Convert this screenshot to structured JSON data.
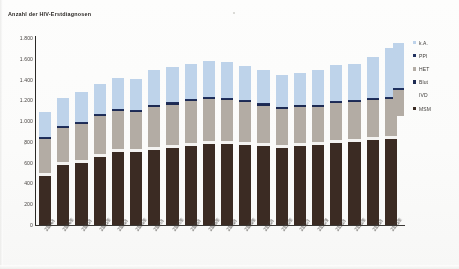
{
  "chart_title": "Anzahl der HIV-Erstdiagnosen",
  "legend": {
    "items": [
      {
        "label": "k.A.",
        "color": "#bed3ea",
        "swatch": "square"
      },
      {
        "label": "PPI",
        "color": "#20305e",
        "swatch": "square"
      },
      {
        "label": "HET",
        "color": "#b3aca4",
        "swatch": "square"
      },
      {
        "label": "Blut",
        "color": "#1d2a52",
        "swatch": "square"
      },
      {
        "label": "IVD",
        "color": "#f4f3f1",
        "swatch": "blank"
      },
      {
        "label": "MSM",
        "color": "#3b2b23",
        "swatch": "square"
      }
    ]
  },
  "chart_data": {
    "type": "bar",
    "stacked": true,
    "title": "Anzahl der HIV-Erstdiagnosen",
    "xlabel": "",
    "ylabel": "Anzahl der HIV-Erstdiagnosen",
    "ylim": [
      0,
      1800
    ],
    "ytick_labels": [
      "1.800",
      "1.600",
      "1.400",
      "1.200",
      "1.000",
      "800",
      "600",
      "400",
      "200",
      "0"
    ],
    "ytick_values": [
      1800,
      1600,
      1400,
      1200,
      1000,
      800,
      600,
      400,
      200,
      0
    ],
    "grid": false,
    "legend_position": "right",
    "categories": [
      "2004/I",
      "2004/II",
      "2005/I",
      "2005/II",
      "2006/I",
      "2006/II",
      "2007/I",
      "2007/II",
      "2008/I",
      "2008/II",
      "2009/I",
      "2009/II",
      "2010/I",
      "2010/II",
      "2011/I",
      "2011/II",
      "2012/I",
      "2012/II",
      "2013/I",
      "2013/II"
    ],
    "series": [
      {
        "name": "MSM",
        "color": "#3b2b23",
        "values": [
          470,
          580,
          600,
          650,
          700,
          700,
          720,
          740,
          760,
          780,
          780,
          770,
          760,
          740,
          760,
          770,
          790,
          800,
          820,
          830
        ]
      },
      {
        "name": "IVD",
        "color": "#f4f3f1",
        "values": [
          30,
          30,
          30,
          30,
          30,
          30,
          30,
          30,
          30,
          30,
          30,
          30,
          30,
          30,
          30,
          30,
          30,
          30,
          30,
          30
        ]
      },
      {
        "name": "HET",
        "color": "#b3aca4",
        "values": [
          330,
          320,
          340,
          370,
          370,
          360,
          390,
          390,
          400,
          400,
          390,
          380,
          360,
          350,
          350,
          340,
          350,
          350,
          350,
          350
        ]
      },
      {
        "name": "Blut",
        "color": "#1d2a52",
        "values": [
          12,
          12,
          12,
          12,
          12,
          12,
          12,
          12,
          12,
          12,
          12,
          12,
          12,
          12,
          12,
          12,
          12,
          12,
          12,
          12
        ]
      },
      {
        "name": "PPI",
        "color": "#20305e",
        "values": [
          8,
          8,
          8,
          8,
          8,
          8,
          8,
          8,
          8,
          8,
          8,
          8,
          8,
          8,
          8,
          8,
          8,
          8,
          8,
          8
        ]
      },
      {
        "name": "k.A.",
        "color": "#bed3ea",
        "values": [
          240,
          270,
          290,
          290,
          300,
          300,
          330,
          340,
          340,
          350,
          350,
          330,
          320,
          300,
          300,
          330,
          350,
          350,
          400,
          470
        ]
      }
    ],
    "totals": [
      1090,
      1220,
      1280,
      1360,
      1420,
      1410,
      1490,
      1520,
      1550,
      1580,
      1570,
      1530,
      1490,
      1440,
      1460,
      1490,
      1540,
      1550,
      1620,
      1700
    ]
  }
}
